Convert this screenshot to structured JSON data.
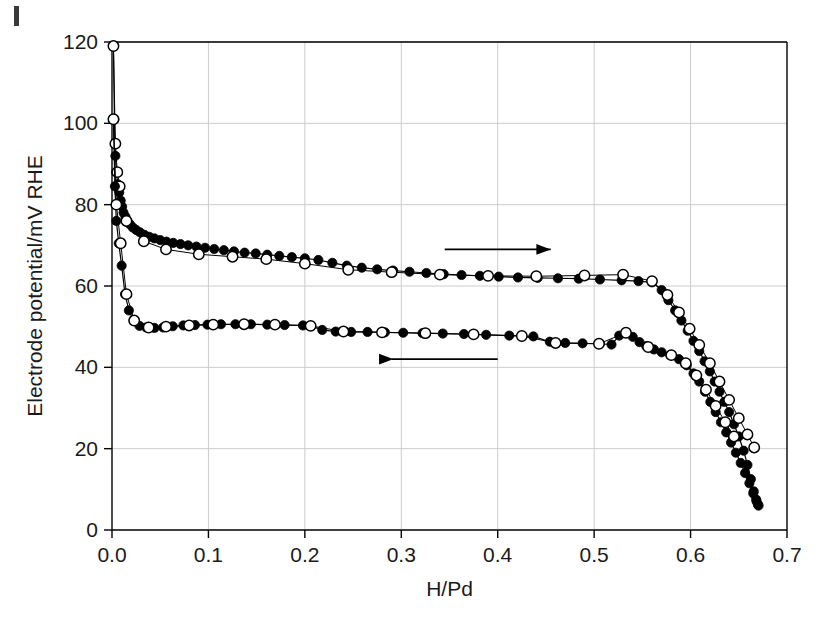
{
  "figure": {
    "background_color": "#ffffff",
    "axis_color": "#000000",
    "grid_color": "#cccccc",
    "marker_filled_color": "#000000",
    "marker_open_fill": "#ffffff"
  },
  "chart_data": {
    "type": "scatter",
    "title": "",
    "xlabel": "H/Pd",
    "ylabel": "Electrode potential/mV RHE",
    "xlim": [
      0.0,
      0.7
    ],
    "ylim": [
      0,
      120
    ],
    "xticks": [
      "0.0",
      "0.1",
      "0.2",
      "0.3",
      "0.4",
      "0.5",
      "0.6",
      "0.7"
    ],
    "xtick_values": [
      0.0,
      0.1,
      0.2,
      0.3,
      0.4,
      0.5,
      0.6,
      0.7
    ],
    "yticks": [
      "0",
      "20",
      "40",
      "60",
      "80",
      "100",
      "120"
    ],
    "ytick_values": [
      0,
      20,
      40,
      60,
      80,
      100,
      120
    ],
    "grid": true,
    "legend": "none",
    "annotations": [
      {
        "name": "absorption-arrow",
        "text": "",
        "direction": "right",
        "x_start": 0.345,
        "x_end": 0.455,
        "y": 69
      },
      {
        "name": "desorption-arrow",
        "text": "",
        "direction": "left",
        "x_start": 0.4,
        "x_end": 0.29,
        "y": 42
      }
    ],
    "series": [
      {
        "name": "absorption-filled",
        "marker": "filled-circle",
        "branch": "absorption",
        "points": [
          [
            0.0015,
            119.0
          ],
          [
            0.0025,
            101.0
          ],
          [
            0.0035,
            92.0
          ],
          [
            0.0045,
            88.0
          ],
          [
            0.006,
            85.0
          ],
          [
            0.0075,
            83.0
          ],
          [
            0.009,
            81.0
          ],
          [
            0.0105,
            79.5
          ],
          [
            0.012,
            78.0
          ],
          [
            0.014,
            77.0
          ],
          [
            0.016,
            76.0
          ],
          [
            0.0185,
            75.2
          ],
          [
            0.0215,
            74.4
          ],
          [
            0.025,
            73.8
          ],
          [
            0.029,
            73.2
          ],
          [
            0.0335,
            72.6
          ],
          [
            0.0385,
            72.1
          ],
          [
            0.044,
            71.7
          ],
          [
            0.05,
            71.3
          ],
          [
            0.0565,
            70.9
          ],
          [
            0.0635,
            70.6
          ],
          [
            0.071,
            70.3
          ],
          [
            0.079,
            70.0
          ],
          [
            0.0875,
            69.7
          ],
          [
            0.0965,
            69.4
          ],
          [
            0.106,
            69.1
          ],
          [
            0.116,
            68.8
          ],
          [
            0.1265,
            68.5
          ],
          [
            0.1375,
            68.2
          ],
          [
            0.149,
            68.0
          ],
          [
            0.161,
            67.7
          ],
          [
            0.1735,
            67.4
          ],
          [
            0.1865,
            67.1
          ],
          [
            0.2,
            66.8
          ],
          [
            0.214,
            66.4
          ],
          [
            0.2285,
            65.7
          ],
          [
            0.2435,
            65.0
          ],
          [
            0.259,
            64.5
          ],
          [
            0.275,
            64.1
          ],
          [
            0.2915,
            63.8
          ],
          [
            0.3085,
            63.5
          ],
          [
            0.326,
            63.2
          ],
          [
            0.344,
            62.9
          ],
          [
            0.3625,
            62.7
          ],
          [
            0.3815,
            62.5
          ],
          [
            0.401,
            62.3
          ],
          [
            0.421,
            62.1
          ],
          [
            0.4415,
            62.0
          ],
          [
            0.4625,
            61.9
          ],
          [
            0.484,
            61.8
          ],
          [
            0.506,
            61.6
          ],
          [
            0.5285,
            61.4
          ],
          [
            0.546,
            61.2
          ],
          [
            0.56,
            60.9
          ],
          [
            0.57,
            59.0
          ],
          [
            0.577,
            56.5
          ],
          [
            0.584,
            54.0
          ],
          [
            0.5905,
            51.5
          ],
          [
            0.597,
            49.0
          ],
          [
            0.603,
            46.5
          ],
          [
            0.609,
            44.0
          ],
          [
            0.6145,
            41.5
          ],
          [
            0.62,
            39.0
          ],
          [
            0.625,
            36.5
          ],
          [
            0.63,
            34.0
          ],
          [
            0.635,
            31.5
          ],
          [
            0.64,
            29.0
          ],
          [
            0.645,
            26.0
          ],
          [
            0.65,
            23.0
          ],
          [
            0.655,
            19.5
          ],
          [
            0.659,
            16.0
          ],
          [
            0.6625,
            12.5
          ],
          [
            0.6655,
            9.5
          ],
          [
            0.668,
            7.5
          ],
          [
            0.67,
            6.2
          ]
        ]
      },
      {
        "name": "absorption-open",
        "marker": "open-circle",
        "branch": "absorption",
        "points": [
          [
            0.0015,
            119.0
          ],
          [
            0.0035,
            95.0
          ],
          [
            0.0055,
            88.0
          ],
          [
            0.008,
            84.5
          ],
          [
            0.015,
            76.0
          ],
          [
            0.033,
            71.0
          ],
          [
            0.056,
            69.0
          ],
          [
            0.09,
            67.8
          ],
          [
            0.125,
            67.2
          ],
          [
            0.16,
            66.6
          ],
          [
            0.2,
            65.5
          ],
          [
            0.245,
            64.0
          ],
          [
            0.29,
            63.4
          ],
          [
            0.34,
            62.8
          ],
          [
            0.39,
            62.5
          ],
          [
            0.44,
            62.4
          ],
          [
            0.49,
            62.6
          ],
          [
            0.53,
            62.8
          ],
          [
            0.56,
            61.2
          ],
          [
            0.576,
            57.8
          ],
          [
            0.588,
            53.5
          ],
          [
            0.599,
            49.5
          ],
          [
            0.609,
            45.5
          ],
          [
            0.62,
            41.0
          ],
          [
            0.63,
            36.5
          ],
          [
            0.64,
            32.0
          ],
          [
            0.65,
            27.5
          ],
          [
            0.659,
            23.5
          ],
          [
            0.666,
            20.3
          ]
        ]
      },
      {
        "name": "desorption-filled",
        "marker": "filled-circle",
        "branch": "desorption",
        "points": [
          [
            0.0015,
            101.0
          ],
          [
            0.003,
            84.5
          ],
          [
            0.0045,
            76.0
          ],
          [
            0.007,
            70.5
          ],
          [
            0.01,
            65.0
          ],
          [
            0.0135,
            58.0
          ],
          [
            0.0175,
            54.0
          ],
          [
            0.0225,
            51.5
          ],
          [
            0.0285,
            50.2
          ],
          [
            0.0355,
            49.8
          ],
          [
            0.044,
            49.7
          ],
          [
            0.053,
            49.8
          ],
          [
            0.063,
            50.1
          ],
          [
            0.074,
            50.3
          ],
          [
            0.086,
            50.4
          ],
          [
            0.099,
            50.5
          ],
          [
            0.113,
            50.6
          ],
          [
            0.128,
            50.6
          ],
          [
            0.144,
            50.6
          ],
          [
            0.161,
            50.5
          ],
          [
            0.179,
            50.4
          ],
          [
            0.198,
            50.3
          ],
          [
            0.206,
            50.2
          ],
          [
            0.218,
            49.2
          ],
          [
            0.232,
            48.8
          ],
          [
            0.248,
            48.7
          ],
          [
            0.265,
            48.7
          ],
          [
            0.283,
            48.6
          ],
          [
            0.302,
            48.5
          ],
          [
            0.322,
            48.4
          ],
          [
            0.343,
            48.3
          ],
          [
            0.365,
            48.2
          ],
          [
            0.388,
            48.0
          ],
          [
            0.412,
            47.8
          ],
          [
            0.437,
            47.6
          ],
          [
            0.454,
            46.3
          ],
          [
            0.47,
            46.0
          ],
          [
            0.488,
            45.9
          ],
          [
            0.506,
            45.8
          ],
          [
            0.518,
            45.6
          ],
          [
            0.526,
            47.8
          ],
          [
            0.533,
            48.5
          ],
          [
            0.54,
            47.5
          ],
          [
            0.547,
            46.2
          ],
          [
            0.554,
            45.2
          ],
          [
            0.562,
            44.4
          ],
          [
            0.57,
            43.7
          ],
          [
            0.579,
            43.0
          ],
          [
            0.588,
            42.0
          ],
          [
            0.596,
            40.5
          ],
          [
            0.603,
            38.5
          ],
          [
            0.609,
            36.5
          ],
          [
            0.615,
            34.0
          ],
          [
            0.6205,
            31.5
          ],
          [
            0.626,
            29.0
          ],
          [
            0.6315,
            26.5
          ],
          [
            0.637,
            24.0
          ],
          [
            0.642,
            21.5
          ],
          [
            0.647,
            19.0
          ],
          [
            0.652,
            16.5
          ],
          [
            0.6565,
            14.0
          ],
          [
            0.661,
            11.5
          ],
          [
            0.665,
            9.0
          ],
          [
            0.6685,
            7.0
          ],
          [
            0.6705,
            6.0
          ]
        ]
      },
      {
        "name": "desorption-open",
        "marker": "open-circle",
        "branch": "desorption",
        "points": [
          [
            0.0015,
            101.0
          ],
          [
            0.0045,
            80.0
          ],
          [
            0.009,
            70.5
          ],
          [
            0.015,
            58.0
          ],
          [
            0.023,
            51.5
          ],
          [
            0.038,
            49.8
          ],
          [
            0.056,
            50.0
          ],
          [
            0.08,
            50.3
          ],
          [
            0.105,
            50.5
          ],
          [
            0.137,
            50.6
          ],
          [
            0.169,
            50.5
          ],
          [
            0.206,
            50.2
          ],
          [
            0.24,
            48.8
          ],
          [
            0.28,
            48.6
          ],
          [
            0.325,
            48.4
          ],
          [
            0.375,
            48.1
          ],
          [
            0.425,
            47.7
          ],
          [
            0.46,
            46.0
          ],
          [
            0.505,
            45.8
          ],
          [
            0.533,
            48.5
          ],
          [
            0.556,
            45.0
          ],
          [
            0.58,
            43.0
          ],
          [
            0.595,
            41.0
          ],
          [
            0.606,
            38.0
          ],
          [
            0.616,
            34.5
          ],
          [
            0.626,
            30.5
          ],
          [
            0.636,
            26.5
          ],
          [
            0.645,
            23.0
          ]
        ]
      }
    ]
  }
}
